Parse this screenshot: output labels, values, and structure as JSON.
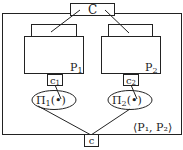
{
  "diagram": {
    "top_component": {
      "label": "C"
    },
    "processes": [
      {
        "label": "P",
        "subscript": "1",
        "connector": {
          "label": "c",
          "subscript": "1"
        },
        "protocol": {
          "label": "Π",
          "subscript": "1",
          "arg": "(•)"
        }
      },
      {
        "label": "P",
        "subscript": "2",
        "connector": {
          "label": "c",
          "subscript": "2"
        },
        "protocol": {
          "label": "Π",
          "subscript": "2",
          "arg": "(•)"
        }
      }
    ],
    "composition_label": "⟨P₁, P₂⟩",
    "bottom_connector": {
      "label": "c"
    },
    "colors": {
      "line": "#222222",
      "background": "#ffffff"
    }
  }
}
